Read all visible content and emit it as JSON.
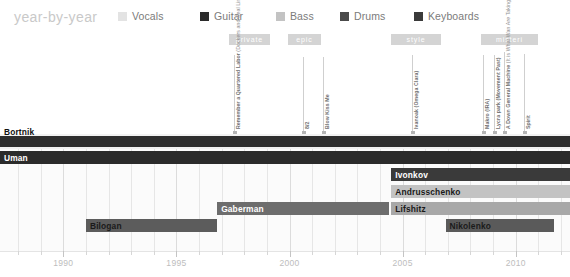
{
  "header": {
    "title": "year-by-year",
    "legend": [
      {
        "label": "Vocals",
        "color": "#e3e3e3",
        "x": 0
      },
      {
        "label": "Guitar",
        "color": "#2b2b2b",
        "x": 82
      },
      {
        "label": "Bass",
        "color": "#c3c3c3",
        "x": 158
      },
      {
        "label": "Drums",
        "color": "#4a4a4a",
        "x": 222
      },
      {
        "label": "Keyboards",
        "color": "#3a3a3a",
        "x": 296
      }
    ]
  },
  "annotations": {
    "groups": [
      {
        "label": "private",
        "x": 229,
        "width": 41
      },
      {
        "label": "epic",
        "x": 288,
        "width": 33
      },
      {
        "label": "style",
        "x": 391,
        "width": 50
      },
      {
        "label": "misteri",
        "x": 481,
        "width": 57
      }
    ],
    "events": [
      {
        "x": 234,
        "top": 25,
        "height": 78,
        "text_main": "Remember a Quartered Labor",
        "text_sub": "(Dockers and Seal Lines)"
      },
      {
        "x": 303,
        "top": 27,
        "height": 76,
        "text_main": "8/2",
        "text_sub": ""
      },
      {
        "x": 323,
        "top": 27,
        "height": 76,
        "text_main": "Blow Kiss Me",
        "text_sub": ""
      },
      {
        "x": 412,
        "top": 25,
        "height": 78,
        "text_main": "Ivanoak (Omega Clara)",
        "text_sub": ""
      },
      {
        "x": 483,
        "top": 25,
        "height": 78,
        "text_main": "Makro (IRA)",
        "text_sub": ""
      },
      {
        "x": 504,
        "top": 22,
        "height": 81,
        "text_main": "A Down General Machine",
        "text_sub": "(It is What Wan Are Taking Away)"
      },
      {
        "x": 524,
        "top": 24,
        "height": 79,
        "text_main": "Spirit",
        "text_sub": ""
      },
      {
        "x": 494,
        "top": 25,
        "height": 78,
        "text_main": "Lycra park (Movement Past)",
        "text_sub": ""
      }
    ]
  },
  "chart_data": {
    "type": "timeline",
    "title": "year-by-year",
    "xlabel": "",
    "ylabel": "",
    "xlim": [
      1987.2,
      2012.4
    ],
    "grid": true,
    "tick_labels": [
      "1990",
      "1995",
      "2000",
      "2005",
      "2010"
    ],
    "tick_years": [
      1990,
      1995,
      2000,
      2005,
      2010
    ],
    "minor_tick_step": 1,
    "rows": [
      {
        "name": "Bortnik",
        "role": "Vocals",
        "start": 1987.2,
        "end": 2012.4,
        "color": "#2e2e2e",
        "band": "#f2f2f2",
        "label_outside": true,
        "label_color": "#111111"
      },
      {
        "name": "Uman",
        "role": "Guitar",
        "start": 1987.2,
        "end": 2012.4,
        "color": "#2b2b2b",
        "band": "#2b2b2b",
        "label_outside": false,
        "label_color": "#ffffff"
      },
      {
        "name": "Ivonkov",
        "role": "Keyboards",
        "start": 2004.5,
        "end": 2012.4,
        "color": "#3a3a3a",
        "band": "#fbfbfb",
        "label_outside": false,
        "label_color": "#ffffff"
      },
      {
        "name": "Andrusschenko",
        "role": "Bass",
        "start": 2004.5,
        "end": 2012.4,
        "color": "#c3c3c3",
        "band": "#fbfbfb",
        "label_outside": false,
        "label_color": "#1a1a1a"
      },
      {
        "name": "Lifshitz",
        "role": "Drums",
        "start": 2004.5,
        "end": 2012.4,
        "color": "#a8a8a8",
        "band": "#fbfbfb",
        "label_outside": false,
        "label_color": "#1a1a1a"
      },
      {
        "name": "Gaberman",
        "role": "Drums",
        "start": 1996.8,
        "end": 2004.4,
        "color": "#6d6d6d",
        "band": "#fbfbfb",
        "label_outside": false,
        "label_color": "#ffffff"
      },
      {
        "name": "Nikolenko",
        "role": "Drums",
        "start": 2006.9,
        "end": 2011.7,
        "color": "#5a5a5a",
        "band": "#fbfbfb",
        "label_outside": false,
        "label_color": "#1a1a1a"
      },
      {
        "name": "Bilogan",
        "role": "Drums",
        "start": 1991.0,
        "end": 1996.8,
        "color": "#5c5c5c",
        "band": "#fbfbfb",
        "label_outside": false,
        "label_color": "#1a1a1a"
      }
    ]
  },
  "axis": {
    "labels": [
      "1990",
      "1995",
      "2000",
      "2005",
      "2010"
    ]
  }
}
